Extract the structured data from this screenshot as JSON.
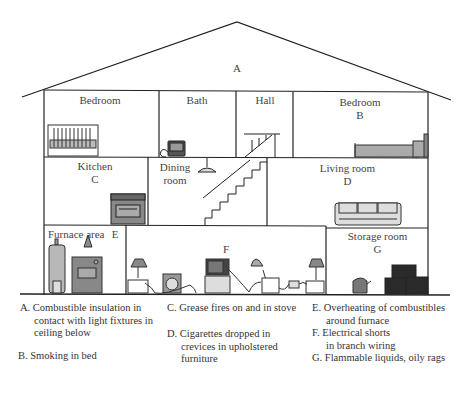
{
  "diagram": {
    "rooms": {
      "attic": {
        "marker": "A"
      },
      "bedroom_left": {
        "label": "Bedroom"
      },
      "bath": {
        "label": "Bath"
      },
      "hall": {
        "label": "Hall"
      },
      "bedroom_right": {
        "label": "Bedroom",
        "marker": "B"
      },
      "kitchen": {
        "label": "Kitchen",
        "marker": "C"
      },
      "dining": {
        "label_line1": "Dining",
        "label_line2": "room"
      },
      "living": {
        "label": "Living room",
        "marker": "D"
      },
      "furnace": {
        "label": "Furnace area",
        "marker": "E"
      },
      "basement": {
        "marker": "F"
      },
      "storage": {
        "label": "Storage room",
        "marker": "G"
      }
    },
    "icons": [
      "crib-icon",
      "space-heater-icon",
      "staircase-icon",
      "bed-icon",
      "stove-icon",
      "ceiling-lamp-icon",
      "sofa-icon",
      "water-heater-icon",
      "furnace-icon",
      "table-lamp-icon",
      "fan-icon",
      "television-icon",
      "desk-lamp-icon",
      "outlet-icon",
      "kettle-icon",
      "boxes-icon"
    ],
    "colors": {
      "line": "#222222",
      "fill_gray": "#a9a9a9",
      "fill_dark": "#2a2a2a",
      "fill_light": "#d8d8d8"
    }
  },
  "legend": {
    "A": {
      "line1": "A. Combustible insulation  in",
      "line2": "contact with light fixtures in",
      "line3": "ceiling below"
    },
    "B": {
      "line1": "B. Smoking in bed"
    },
    "C": {
      "line1": "C. Grease fires on and in stove"
    },
    "D": {
      "line1": "D. Cigarettes dropped in",
      "line2": "crevices in upholstered",
      "line3": "furniture"
    },
    "E": {
      "line1": "E. Overheating of combustibles",
      "line2": "around furnace"
    },
    "F": {
      "line1": "F.  Electrical shorts",
      "line2": "in branch wiring"
    },
    "G": {
      "line1": "G. Flammable liquids, oily rags"
    }
  }
}
